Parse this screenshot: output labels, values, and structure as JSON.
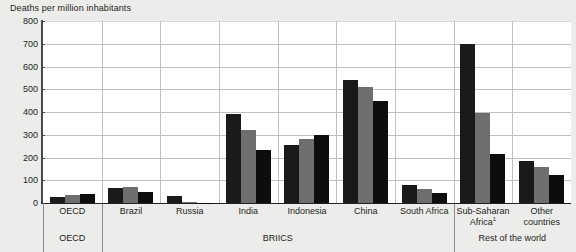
{
  "axis_title": "Deaths per million inhabitants",
  "y_ticks": [
    800,
    700,
    600,
    500,
    400,
    300,
    200,
    100,
    0
  ],
  "bands": [
    {
      "label": "OECD"
    },
    {
      "label": "BRIICS"
    },
    {
      "label": "Rest of the world"
    }
  ],
  "footnote_marker": "1",
  "chart_data": {
    "type": "bar",
    "title": "",
    "xlabel": "",
    "ylabel": "Deaths per million inhabitants",
    "ylim": [
      0,
      800
    ],
    "ytick_step": 100,
    "grid": "horizontal-and-category-separators",
    "legend": "none",
    "categories": [
      "OECD",
      "Brazil",
      "Russia",
      "India",
      "Indonesia",
      "China",
      "South Africa",
      "Sub-Saharan Africa¹",
      "Other countries"
    ],
    "category_groups": [
      {
        "name": "OECD",
        "categories": [
          "OECD"
        ]
      },
      {
        "name": "BRIICS",
        "categories": [
          "Brazil",
          "Russia",
          "India",
          "Indonesia",
          "China",
          "South Africa"
        ]
      },
      {
        "name": "Rest of the world",
        "categories": [
          "Sub-Saharan Africa¹",
          "Other countries"
        ]
      }
    ],
    "series": [
      {
        "name": "series-1",
        "color": "#1a1a1a",
        "values": [
          25,
          65,
          30,
          390,
          255,
          540,
          80,
          700,
          185
        ]
      },
      {
        "name": "series-2",
        "color": "#6e6e6e",
        "values": [
          35,
          72,
          3,
          320,
          280,
          510,
          60,
          397,
          160
        ]
      },
      {
        "name": "series-3",
        "color": "#0d0d0d",
        "values": [
          40,
          48,
          2,
          235,
          297,
          447,
          42,
          215,
          125
        ]
      }
    ]
  }
}
